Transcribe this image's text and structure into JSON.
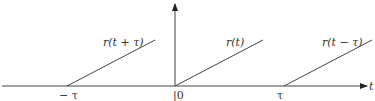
{
  "diagram": {
    "title": "",
    "axis": {
      "x_label": "t"
    },
    "ticks": [
      {
        "id": "neg-tau",
        "label": "− τ",
        "value": -1
      },
      {
        "id": "zero",
        "label": "|0",
        "value": 0
      },
      {
        "id": "tau",
        "label": "τ",
        "value": 1
      }
    ],
    "ramps": [
      {
        "id": "r-t-plus-tau",
        "label": "r(t + τ)",
        "start": -1
      },
      {
        "id": "r-t",
        "label": "r(t)",
        "start": 0
      },
      {
        "id": "r-t-minus-tau",
        "label": "r(t − τ)",
        "start": 1
      }
    ],
    "colors": {
      "line": "#444444",
      "text": "#333333"
    }
  }
}
